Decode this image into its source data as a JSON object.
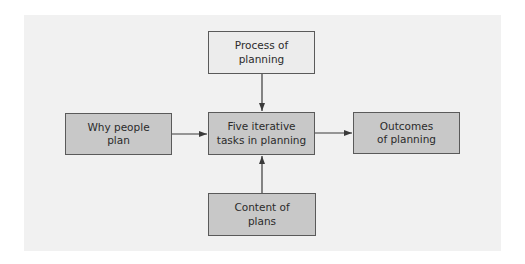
{
  "diagram": {
    "colors": {
      "panel_background": "#f1f1f1",
      "input_box_fill": "#ececec",
      "box_fill": "#c8c8c8",
      "border": "#5a5a5a",
      "arrow": "#3a3a3a"
    },
    "nodes": {
      "process": {
        "label": "Process of\nplanning"
      },
      "why": {
        "label": "Why people\nplan"
      },
      "tasks": {
        "label": "Five iterative\ntasks in planning"
      },
      "outcomes": {
        "label": "Outcomes\nof planning"
      },
      "content": {
        "label": "Content of\nplans"
      }
    },
    "edges": [
      {
        "from": "process",
        "to": "tasks"
      },
      {
        "from": "why",
        "to": "tasks"
      },
      {
        "from": "content",
        "to": "tasks"
      },
      {
        "from": "tasks",
        "to": "outcomes"
      }
    ]
  }
}
